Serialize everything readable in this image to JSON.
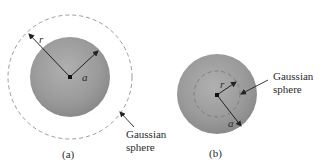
{
  "figure_a": {
    "caption": "(a)",
    "label_r": "r",
    "label_a": "a",
    "gaussian_label_line1": "Gaussian",
    "gaussian_label_line2": "sphere"
  },
  "figure_b": {
    "caption": "(b)",
    "label_r": "r",
    "label_a": "a",
    "gaussian_label_line1": "Gaussian",
    "gaussian_label_line2": "sphere"
  },
  "colors": {
    "sphere_fill": "#9a9a9a",
    "dashed_line": "#9c9c9c",
    "arrow": "#222222",
    "text": "#2a2a2a"
  }
}
